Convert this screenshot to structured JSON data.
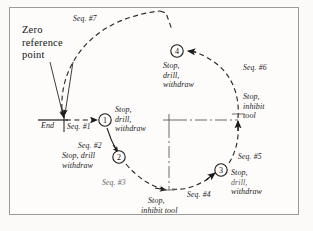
{
  "figure": {
    "title_text": "Zero\nreference\npoint",
    "background": "#fbfaf8",
    "frame_color": "#9a9a98",
    "ink_color": "#1b1b1b"
  },
  "annotations": {
    "zero_reference": "Zero\nreference\npoint",
    "end_label": "End"
  },
  "sequences": [
    {
      "id": "seq1",
      "label": "Seq. #1"
    },
    {
      "id": "seq2",
      "label": "Seq. #2"
    },
    {
      "id": "seq3",
      "label": "Seq. #3"
    },
    {
      "id": "seq4",
      "label": "Seq. #4"
    },
    {
      "id": "seq5",
      "label": "Seq. #5"
    },
    {
      "id": "seq6",
      "label": "Seq. #6"
    },
    {
      "id": "seq7",
      "label": "Seq. #7"
    }
  ],
  "nodes": [
    {
      "id": "node1",
      "number": "1",
      "action": "Stop,\ndrill,\nwithdraw"
    },
    {
      "id": "node2",
      "number": "2",
      "action": "Stop, drill\nwithdraw"
    },
    {
      "id": "node3",
      "number": "3",
      "action": "Stop,\ndrill,\nwithdraw"
    },
    {
      "id": "node4",
      "number": "4",
      "action": "Stop,\ndrill,\nwithdraw"
    }
  ],
  "stop_points": [
    {
      "id": "stop_bottom",
      "action": "Stop,\ninhibit tool"
    },
    {
      "id": "stop_right",
      "action": "Stop,\ninhibit\ntool"
    }
  ],
  "node_actions": {
    "node1_line1": "Stop,",
    "node1_line2": "drill,",
    "node1_line3": "withdraw",
    "node2_line1": "Stop, drill",
    "node2_line2": "withdraw",
    "node3_line1": "Stop,",
    "node3_line2": "drill,",
    "node3_line3": "withdraw",
    "node4_line1": "Stop,",
    "node4_line2": "drill,",
    "node4_line3": "withdraw"
  },
  "stop_actions": {
    "bottom_line1": "Stop,",
    "bottom_line2": "inhibit tool",
    "right_line1": "Stop,",
    "right_line2": "inhibit",
    "right_line3": "tool"
  }
}
